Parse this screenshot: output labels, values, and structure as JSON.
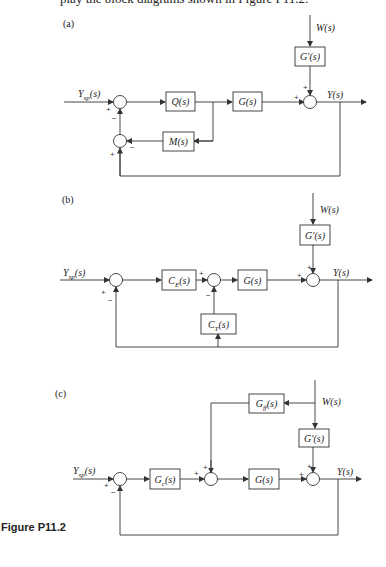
{
  "top_text": "play the block diagrams shown in Figure P11.2.",
  "figure_caption": "Figure P11.2",
  "panels": {
    "a": {
      "label": "(a)",
      "input": "Y",
      "input_sub": "sp",
      "input_suffix": "(s)",
      "disturbance": "W(s)",
      "output": "Y(s)",
      "blocks": {
        "q": "Q(s)",
        "g": "G(s)",
        "m": "M(s)",
        "gprime": "G′(s)"
      },
      "signs": {
        "sum1_in": "+",
        "sum1_fb": "−",
        "sum2_in": "−",
        "sum2_fb": "+",
        "sum3_main": "+",
        "sum3_dist": "+"
      }
    },
    "b": {
      "label": "(b)",
      "input": "Y",
      "input_sub": "sp",
      "input_suffix": "(s)",
      "disturbance": "W(s)",
      "output": "Y(s)",
      "blocks": {
        "ce": "C",
        "ce_sub": "E",
        "ce_suffix": "(s)",
        "g": "G(s)",
        "ct": "C",
        "ct_sub": "T",
        "ct_suffix": "(s)",
        "gprime": "G′(s)"
      },
      "signs": {
        "sum1_in": "+",
        "sum1_fb": "−",
        "sum2_in": "+",
        "sum2_fb": "−",
        "sum3_main": "+",
        "sum3_dist": "+"
      }
    },
    "c": {
      "label": "(c)",
      "input": "Y",
      "input_sub": "sp",
      "input_suffix": "(s)",
      "disturbance": "W(s)",
      "output": "Y(s)",
      "blocks": {
        "gc": "G",
        "gc_sub": "c",
        "gc_suffix": "(s)",
        "gff": "G",
        "gff_sub": "ff",
        "gff_suffix": "(s)",
        "g": "G(s)",
        "gprime": "G′(s)"
      },
      "signs": {
        "sum1_in": "+",
        "sum1_fb": "−",
        "sum2_in": "+",
        "sum2_ff": "+",
        "sum3_main": "+",
        "sum3_dist": "+"
      }
    }
  }
}
